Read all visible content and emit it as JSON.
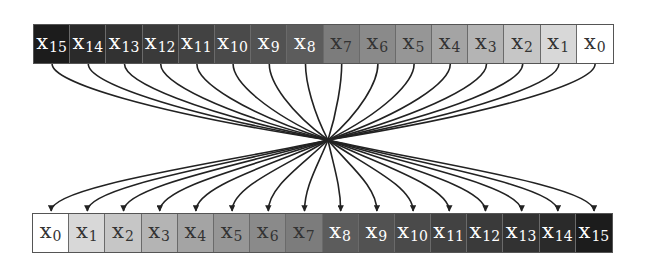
{
  "diagram": {
    "type": "bit-reversal / permutation crossing diagram",
    "top_row": {
      "cells": [
        {
          "label": "x",
          "index": "15",
          "fill": "#1c1c1c",
          "text_color": "#ffffff"
        },
        {
          "label": "x",
          "index": "14",
          "fill": "#2a2a2a",
          "text_color": "#ffffff"
        },
        {
          "label": "x",
          "index": "13",
          "fill": "#323232",
          "text_color": "#ffffff"
        },
        {
          "label": "x",
          "index": "12",
          "fill": "#3a3a3a",
          "text_color": "#ffffff"
        },
        {
          "label": "x",
          "index": "11",
          "fill": "#424242",
          "text_color": "#ffffff"
        },
        {
          "label": "x",
          "index": "10",
          "fill": "#4a4a4a",
          "text_color": "#ffffff"
        },
        {
          "label": "x",
          "index": "9",
          "fill": "#525252",
          "text_color": "#ffffff"
        },
        {
          "label": "x",
          "index": "8",
          "fill": "#5c5c5c",
          "text_color": "#ffffff"
        },
        {
          "label": "x",
          "index": "7",
          "fill": "#7c7c7c",
          "text_color": "#333333"
        },
        {
          "label": "x",
          "index": "6",
          "fill": "#8a8a8a",
          "text_color": "#333333"
        },
        {
          "label": "x",
          "index": "5",
          "fill": "#969696",
          "text_color": "#333333"
        },
        {
          "label": "x",
          "index": "4",
          "fill": "#a4a4a4",
          "text_color": "#333333"
        },
        {
          "label": "x",
          "index": "3",
          "fill": "#b4b4b4",
          "text_color": "#333333"
        },
        {
          "label": "x",
          "index": "2",
          "fill": "#c6c6c6",
          "text_color": "#333333"
        },
        {
          "label": "x",
          "index": "1",
          "fill": "#d8d8d8",
          "text_color": "#333333"
        },
        {
          "label": "x",
          "index": "0",
          "fill": "#ffffff",
          "text_color": "#333333"
        }
      ]
    },
    "bottom_row": {
      "cells": [
        {
          "label": "x",
          "index": "0",
          "fill": "#ffffff",
          "text_color": "#333333"
        },
        {
          "label": "x",
          "index": "1",
          "fill": "#d8d8d8",
          "text_color": "#333333"
        },
        {
          "label": "x",
          "index": "2",
          "fill": "#c6c6c6",
          "text_color": "#333333"
        },
        {
          "label": "x",
          "index": "3",
          "fill": "#b4b4b4",
          "text_color": "#333333"
        },
        {
          "label": "x",
          "index": "4",
          "fill": "#a4a4a4",
          "text_color": "#333333"
        },
        {
          "label": "x",
          "index": "5",
          "fill": "#969696",
          "text_color": "#333333"
        },
        {
          "label": "x",
          "index": "6",
          "fill": "#8a8a8a",
          "text_color": "#333333"
        },
        {
          "label": "x",
          "index": "7",
          "fill": "#7c7c7c",
          "text_color": "#333333"
        },
        {
          "label": "x",
          "index": "8",
          "fill": "#5c5c5c",
          "text_color": "#ffffff"
        },
        {
          "label": "x",
          "index": "9",
          "fill": "#525252",
          "text_color": "#ffffff"
        },
        {
          "label": "x",
          "index": "10",
          "fill": "#4a4a4a",
          "text_color": "#ffffff"
        },
        {
          "label": "x",
          "index": "11",
          "fill": "#424242",
          "text_color": "#ffffff"
        },
        {
          "label": "x",
          "index": "12",
          "fill": "#3a3a3a",
          "text_color": "#ffffff"
        },
        {
          "label": "x",
          "index": "13",
          "fill": "#323232",
          "text_color": "#ffffff"
        },
        {
          "label": "x",
          "index": "14",
          "fill": "#2a2a2a",
          "text_color": "#ffffff"
        },
        {
          "label": "x",
          "index": "15",
          "fill": "#1c1c1c",
          "text_color": "#ffffff"
        }
      ]
    },
    "connections": {
      "count": 16,
      "convergence_point": {
        "x": 328,
        "y": 140
      },
      "line_color": "#222222",
      "arrowheads": "on bottom row"
    }
  }
}
